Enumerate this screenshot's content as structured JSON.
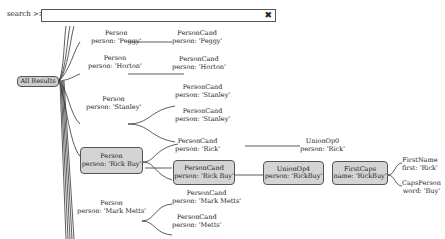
{
  "search": {
    "label": "search >>",
    "value": "",
    "clear_icon": "✖"
  },
  "root": {
    "label": "All Results"
  },
  "nodes": {
    "peggy_person": {
      "l1": "Person",
      "l2": "person: 'Peggy'"
    },
    "peggy_cand": {
      "l1": "PersonCand",
      "l2": "person: 'Peggy'"
    },
    "horton_person": {
      "l1": "Person",
      "l2": "person: 'Horton'"
    },
    "horton_cand": {
      "l1": "PersonCand",
      "l2": "person: 'Horton'"
    },
    "stanley_person": {
      "l1": "Person",
      "l2": "person: 'Stanley'"
    },
    "stanley_cand1": {
      "l1": "PersonCand",
      "l2": "person: 'Stanley'"
    },
    "stanley_cand2": {
      "l1": "PersonCand",
      "l2": "person: 'Stanley'"
    },
    "rick_person": {
      "l1": "Person",
      "l2": "person: 'Rick Buy'"
    },
    "rick_cand1": {
      "l1": "PersonCand",
      "l2": "person: 'Rick'"
    },
    "rick_union0": {
      "l1": "UnionOp0",
      "l2": "person: 'Rick'"
    },
    "rick_cand2": {
      "l1": "PersonCand",
      "l2": "person: 'Rick Buy'"
    },
    "rick_union4": {
      "l1": "UnionOp4",
      "l2": "person: 'RickBuy'"
    },
    "rick_firstcaps": {
      "l1": "FirstCaps",
      "l2": "name: 'RickBuy'"
    },
    "rick_firstname": {
      "l1": "FirstName",
      "l2": "first: 'Rick'"
    },
    "rick_capsperson": {
      "l1": "CapsPerson",
      "l2": "word: 'Buy'"
    },
    "mark_person": {
      "l1": "Person",
      "l2": "person: 'Mark Metts'"
    },
    "mark_cand1": {
      "l1": "PersonCand",
      "l2": "person: 'Mark Metts'"
    },
    "mark_cand2": {
      "l1": "PersonCand",
      "l2": "person: 'Metts'"
    }
  }
}
